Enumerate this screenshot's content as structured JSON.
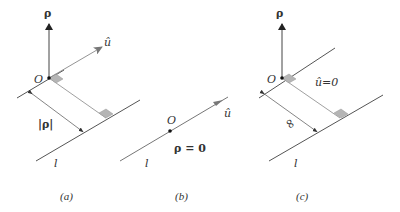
{
  "figure": {
    "colors": {
      "line": "#444444",
      "arrow_dark": "#222222",
      "arrow_gray": "#777777",
      "square_fill": "#b5b5b5",
      "text": "#333333"
    },
    "panels": [
      {
        "id": "a",
        "caption": "(a)",
        "origin_label": "O",
        "rho_label": "ρ",
        "u_label": "û",
        "distance_label": "|ρ|",
        "line_label": "l"
      },
      {
        "id": "b",
        "caption": "(b)",
        "origin_label": "O",
        "u_label": "û",
        "condition_label": "ρ = 0",
        "line_label": "l"
      },
      {
        "id": "c",
        "caption": "(c)",
        "origin_label": "O",
        "rho_label": "ρ",
        "condition_label": "û=0",
        "distance_label": "∞",
        "line_label": "l"
      }
    ]
  }
}
